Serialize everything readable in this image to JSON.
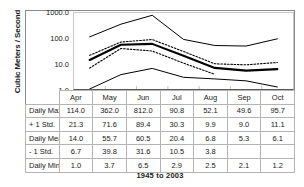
{
  "chart_data": {
    "type": "line",
    "title": "",
    "subtitle": "",
    "xlabel": "",
    "ylabel": "Cubic Meters / Second",
    "caption": "1945 to 2003",
    "yscale": "log",
    "ylim": [
      1.0,
      1000.0
    ],
    "yticklabels": [
      "1000.0",
      "100.0",
      "10.0",
      "1.0"
    ],
    "ytickvalues": [
      1000.0,
      100.0,
      10.0,
      1.0
    ],
    "grid": false,
    "legend": "none",
    "categories": [
      "Apr",
      "May",
      "Jun",
      "Jul",
      "Aug",
      "Sep",
      "Oct"
    ],
    "series": [
      {
        "name": "Daily Max",
        "style": "solid-thin",
        "values": [
          114.0,
          362.0,
          812.0,
          90.8,
          52.1,
          49.6,
          95.7
        ]
      },
      {
        "name": "+ 1 Std.",
        "style": "dotted",
        "values": [
          21.3,
          71.6,
          89.4,
          30.3,
          9.9,
          9.0,
          11.1
        ]
      },
      {
        "name": "Daily Mean",
        "style": "solid-thick",
        "values": [
          14.0,
          55.7,
          60.5,
          20.4,
          6.8,
          5.3,
          6.1
        ]
      },
      {
        "name": "- 1 Std.",
        "style": "dotted",
        "values": [
          6.7,
          39.8,
          31.6,
          10.5,
          3.8,
          null,
          null
        ]
      },
      {
        "name": "Daily Min.",
        "style": "solid-thin",
        "values": [
          1.0,
          3.7,
          6.5,
          2.9,
          2.5,
          2.1,
          1.2
        ]
      }
    ]
  },
  "table": {
    "columns": [
      "",
      "Apr",
      "May",
      "Jun",
      "Jul",
      "Aug",
      "Sep",
      "Oct"
    ],
    "rows": [
      {
        "label": "Daily Max",
        "cells": [
          "114.0",
          "362.0",
          "812.0",
          "90.8",
          "52.1",
          "49.6",
          "95.7"
        ]
      },
      {
        "label": "+ 1 Std.",
        "cells": [
          "21.3",
          "71.6",
          "89.4",
          "30.3",
          "9.9",
          "9.0",
          "11.1"
        ]
      },
      {
        "label": "Daily Mean",
        "cells": [
          "14.0",
          "55.7",
          "60.5",
          "20.4",
          "6.8",
          "5.3",
          "6.1"
        ]
      },
      {
        "label": "- 1 Std.",
        "cells": [
          "6.7",
          "39.8",
          "31.6",
          "10.5",
          "3.8",
          "",
          ""
        ]
      },
      {
        "label": "Daily Min.",
        "cells": [
          "1.0",
          "3.7",
          "6.5",
          "2.9",
          "2.5",
          "2.1",
          "1.2"
        ]
      }
    ]
  },
  "colors": {
    "line": "#000000",
    "frame": "#8a8a8a",
    "grid": "#c8c8c8",
    "table_border": "#b4b4b4",
    "text": "#1a1a1a",
    "background": "#ffffff"
  }
}
